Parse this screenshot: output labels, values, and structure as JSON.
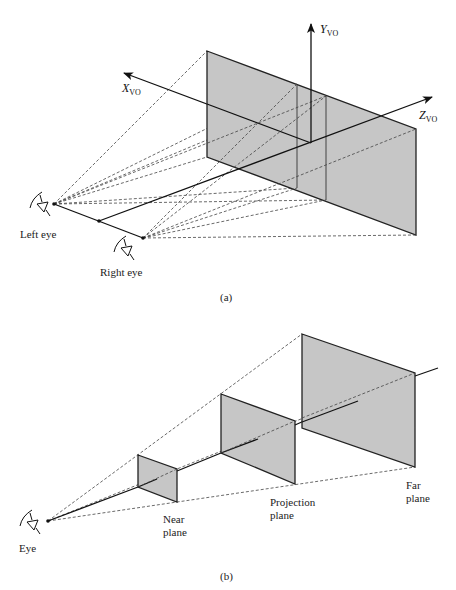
{
  "figure_a": {
    "caption": "(a)",
    "axes": {
      "x": {
        "letter": "X",
        "subscript": "VO"
      },
      "y": {
        "letter": "Y",
        "subscript": "VO"
      },
      "z": {
        "letter": "Z",
        "subscript": "VO"
      }
    },
    "labels": {
      "left_eye": "Left eye",
      "right_eye": "Right eye"
    }
  },
  "figure_b": {
    "caption": "(b)",
    "labels": {
      "eye": "Eye",
      "near_plane_line1": "Near",
      "near_plane_line2": "plane",
      "projection_plane_line1": "Projection",
      "projection_plane_line2": "plane",
      "far_plane_line1": "Far",
      "far_plane_line2": "plane"
    }
  },
  "colors": {
    "plane_fill": "#c6c6c6",
    "line": "#1a1a1a",
    "background": "#ffffff"
  }
}
